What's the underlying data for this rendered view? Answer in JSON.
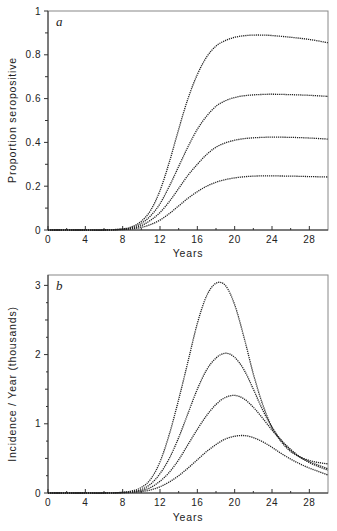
{
  "figure": {
    "panels": [
      {
        "letter": "a",
        "xlabel": "Years",
        "ylabel": "Proportion seropositive"
      },
      {
        "letter": "b",
        "xlabel": "Years",
        "ylabel": "Incidence / Year (thousands)"
      }
    ]
  },
  "chart_data": [
    {
      "type": "line",
      "panel": "a",
      "title": "",
      "xlabel": "Years",
      "ylabel": "Proportion seropositive",
      "xlim": [
        0,
        30
      ],
      "ylim": [
        0,
        1
      ],
      "xticks": [
        0,
        4,
        8,
        12,
        16,
        20,
        24,
        28
      ],
      "yticks": [
        0,
        0.2,
        0.4,
        0.6,
        0.8,
        1
      ],
      "ytick_labels": [
        "0",
        "0.2",
        "0.4",
        "0.6",
        "0.8",
        "1"
      ],
      "grid": false,
      "legend": null,
      "x": [
        0,
        2,
        4,
        6,
        8,
        9,
        10,
        11,
        12,
        13,
        14,
        15,
        16,
        17,
        18,
        19,
        20,
        21,
        22,
        23,
        24,
        26,
        28,
        30
      ],
      "series": [
        {
          "name": "curve 1",
          "values": [
            0,
            0,
            0,
            0,
            0.005,
            0.015,
            0.04,
            0.09,
            0.18,
            0.31,
            0.46,
            0.6,
            0.71,
            0.79,
            0.84,
            0.865,
            0.88,
            0.887,
            0.89,
            0.89,
            0.888,
            0.88,
            0.87,
            0.855
          ]
        },
        {
          "name": "curve 2",
          "values": [
            0,
            0,
            0,
            0,
            0.004,
            0.011,
            0.03,
            0.065,
            0.12,
            0.2,
            0.29,
            0.38,
            0.46,
            0.52,
            0.565,
            0.59,
            0.605,
            0.613,
            0.617,
            0.619,
            0.62,
            0.618,
            0.615,
            0.61
          ]
        },
        {
          "name": "curve 3",
          "values": [
            0,
            0,
            0,
            0,
            0.003,
            0.008,
            0.02,
            0.045,
            0.08,
            0.13,
            0.19,
            0.25,
            0.3,
            0.345,
            0.378,
            0.398,
            0.41,
            0.417,
            0.421,
            0.423,
            0.424,
            0.423,
            0.42,
            0.415
          ]
        },
        {
          "name": "curve 4",
          "values": [
            0,
            0,
            0,
            0,
            0.002,
            0.005,
            0.012,
            0.025,
            0.045,
            0.075,
            0.11,
            0.145,
            0.175,
            0.2,
            0.218,
            0.23,
            0.238,
            0.243,
            0.246,
            0.247,
            0.247,
            0.246,
            0.244,
            0.242
          ]
        }
      ]
    },
    {
      "type": "line",
      "panel": "b",
      "title": "",
      "xlabel": "Years",
      "ylabel": "Incidence / Year (thousands)",
      "xlim": [
        0,
        30
      ],
      "ylim": [
        0,
        3.15
      ],
      "xticks": [
        0,
        4,
        8,
        12,
        16,
        20,
        24,
        28
      ],
      "yticks": [
        0,
        1,
        2,
        3
      ],
      "ytick_labels": [
        "0",
        "1",
        "2",
        "3"
      ],
      "grid": false,
      "legend": null,
      "x": [
        0,
        2,
        4,
        6,
        8,
        9,
        10,
        11,
        12,
        13,
        14,
        15,
        16,
        17,
        18,
        19,
        20,
        21,
        22,
        23,
        24,
        25,
        26,
        27,
        28,
        29,
        30
      ],
      "series": [
        {
          "name": "curve 1",
          "values": [
            0,
            0,
            0,
            0,
            0.01,
            0.03,
            0.08,
            0.2,
            0.45,
            0.85,
            1.35,
            1.9,
            2.45,
            2.85,
            3.03,
            3.0,
            2.72,
            2.25,
            1.72,
            1.28,
            0.95,
            0.74,
            0.6,
            0.52,
            0.47,
            0.44,
            0.42
          ]
        },
        {
          "name": "curve 2",
          "values": [
            0,
            0,
            0,
            0,
            0.008,
            0.02,
            0.05,
            0.13,
            0.28,
            0.5,
            0.8,
            1.15,
            1.5,
            1.78,
            1.95,
            2.02,
            1.96,
            1.78,
            1.5,
            1.2,
            0.95,
            0.76,
            0.62,
            0.52,
            0.45,
            0.4,
            0.35
          ]
        },
        {
          "name": "curve 3",
          "values": [
            0,
            0,
            0,
            0,
            0.006,
            0.015,
            0.035,
            0.08,
            0.17,
            0.3,
            0.48,
            0.7,
            0.92,
            1.12,
            1.28,
            1.38,
            1.41,
            1.36,
            1.24,
            1.08,
            0.91,
            0.76,
            0.63,
            0.52,
            0.44,
            0.38,
            0.33
          ]
        },
        {
          "name": "curve 4",
          "values": [
            0,
            0,
            0,
            0,
            0.004,
            0.01,
            0.02,
            0.045,
            0.09,
            0.16,
            0.25,
            0.36,
            0.48,
            0.6,
            0.7,
            0.78,
            0.82,
            0.83,
            0.8,
            0.74,
            0.66,
            0.57,
            0.49,
            0.42,
            0.36,
            0.31,
            0.26
          ]
        }
      ]
    }
  ]
}
